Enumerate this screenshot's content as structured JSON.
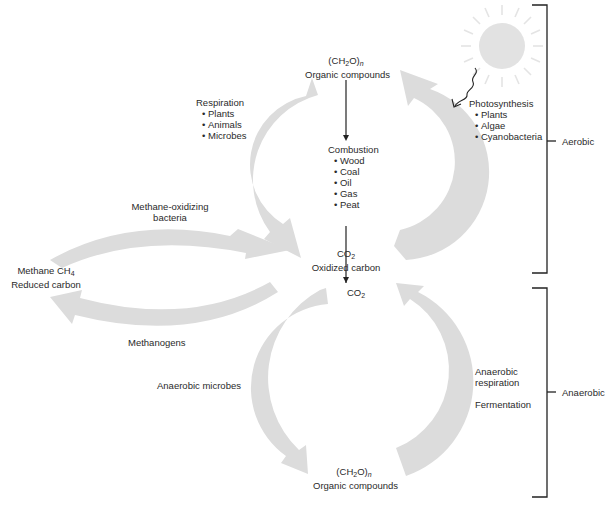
{
  "diagram": {
    "type": "carbon-cycle",
    "colors": {
      "arrow_fill": "#dcdcdc",
      "sun_fill": "#e2e2e2",
      "line": "#222222",
      "text": "#2a2a2a"
    },
    "aerobic_cycle": {
      "top_node": {
        "formula": "(CH",
        "formula_sub": "2",
        "formula_tail": "O)",
        "formula_n": "n",
        "label": "Organic compounds"
      },
      "bottom_node": {
        "formula": "CO",
        "formula_sub": "2",
        "label": "Oxidized carbon"
      },
      "left_process": {
        "title": "Respiration",
        "items": [
          "Plants",
          "Animals",
          "Microbes"
        ]
      },
      "right_process": {
        "title": "Photosynthesis",
        "items": [
          "Plants",
          "Algae",
          "Cyanobacteria"
        ]
      },
      "center_process": {
        "title": "Combustion",
        "items": [
          "Wood",
          "Coal",
          "Oil",
          "Gas",
          "Peat"
        ]
      },
      "sun": "sun-icon"
    },
    "methane_cycle": {
      "node": {
        "label_line1": "Methane CH",
        "label_sub": "4",
        "label_line2": "Reduced carbon"
      },
      "top_process": {
        "line1": "Methane-oxidizing",
        "line2": "bacteria"
      },
      "bottom_process": "Methanogens"
    },
    "anaerobic_cycle": {
      "top_node": {
        "formula": "CO",
        "formula_sub": "2"
      },
      "bottom_node": {
        "formula": "(CH",
        "formula_sub": "2",
        "formula_tail": "O)",
        "formula_n": "n",
        "label": "Organic compounds"
      },
      "left_process": "Anaerobic microbes",
      "right_process": {
        "line1": "Anaerobic",
        "line2": "respiration",
        "line3": "Fermentation"
      }
    },
    "brackets": {
      "aerobic": "Aerobic",
      "anaerobic": "Anaerobic"
    }
  }
}
